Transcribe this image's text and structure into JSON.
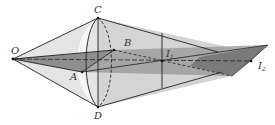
{
  "diagram": {
    "type": "geometry-cone-light-rays",
    "colors": {
      "background": "#ffffff",
      "cone_fill": "#d4d4d4",
      "inner_fill": "#9a9a9a",
      "dark_fill": "#6e6e6e",
      "lens_fill": "#f2f2f2",
      "stroke": "#222222"
    },
    "points": {
      "O": {
        "label": "O",
        "x": 13,
        "y": 59
      },
      "C": {
        "label": "C",
        "x": 98,
        "y": 18
      },
      "D": {
        "label": "D",
        "x": 98,
        "y": 107
      },
      "A": {
        "label": "A",
        "x": 82,
        "y": 72
      },
      "B": {
        "label": "B",
        "x": 114,
        "y": 50
      },
      "I1": {
        "label": "I",
        "subscript": "1",
        "x": 162,
        "y": 61
      },
      "I2": {
        "label": "I",
        "subscript": "2",
        "x": 251,
        "y": 61
      }
    },
    "labels": {
      "O": "O",
      "C": "C",
      "D": "D",
      "A": "A",
      "B": "B",
      "I": "I",
      "sub1": "1",
      "sub2": "2"
    }
  }
}
